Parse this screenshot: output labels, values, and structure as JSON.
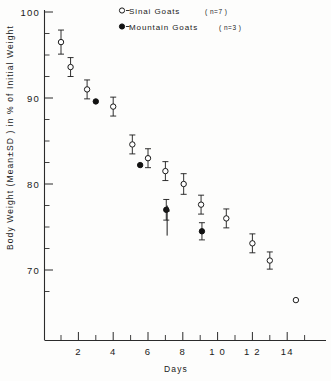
{
  "chart_data": {
    "type": "scatter",
    "title": "",
    "xlabel": "Days",
    "ylabel": "Body Weight (Mean±SD) in % of Initial Weight",
    "xlim": [
      0,
      15.5
    ],
    "ylim": [
      64.5,
      100
    ],
    "grid": false,
    "legend_position": "top-center",
    "x_ticks": [
      2,
      4,
      6,
      8,
      10,
      12,
      14
    ],
    "x_tick_labels": [
      "2",
      "4",
      "6",
      "8",
      "1 0",
      "1 2",
      "14"
    ],
    "x_minor_ticks": [
      1,
      3,
      5,
      7,
      9,
      11,
      13,
      15
    ],
    "y_ticks": [
      70,
      80,
      90,
      100
    ],
    "y_tick_labels": [
      "70",
      "80",
      "90",
      "100"
    ],
    "y_minor_ticks": [
      67.5,
      72.5,
      75,
      77.5,
      82.5,
      85,
      87.5,
      92.5,
      95,
      97.5
    ],
    "series": [
      {
        "name": "Sinai Goats",
        "sample_size": "n=7",
        "marker": "open-circle",
        "legend_label": "o - Sinai  Goats",
        "legend_n": "( n=7 )",
        "points": [
          {
            "x": 1.0,
            "y": 96.5,
            "sd": 1.4
          },
          {
            "x": 1.55,
            "y": 93.6,
            "sd": 1.1
          },
          {
            "x": 2.5,
            "y": 91.0,
            "sd": 1.1
          },
          {
            "x": 4.0,
            "y": 89.0,
            "sd": 1.1
          },
          {
            "x": 5.1,
            "y": 84.6,
            "sd": 1.1
          },
          {
            "x": 6.0,
            "y": 83.0,
            "sd": 1.1
          },
          {
            "x": 7.0,
            "y": 81.5,
            "sd": 1.1
          },
          {
            "x": 8.05,
            "y": 80.0,
            "sd": 1.2
          },
          {
            "x": 9.05,
            "y": 77.6,
            "sd": 1.1
          },
          {
            "x": 10.5,
            "y": 76.0,
            "sd": 1.1
          },
          {
            "x": 12.0,
            "y": 73.1,
            "sd": 1.1
          },
          {
            "x": 13.0,
            "y": 71.1,
            "sd": 1.0
          },
          {
            "x": 14.5,
            "y": 66.5,
            "sd": 0.0
          }
        ]
      },
      {
        "name": "Mountain Goats",
        "sample_size": "n=3",
        "marker": "filled-circle",
        "legend_label": "• - Mountain Goats",
        "legend_n": "( n=3 )",
        "points": [
          {
            "x": 3.0,
            "y": 89.6,
            "sd": 0.0
          },
          {
            "x": 5.55,
            "y": 82.2,
            "sd": 0.0
          },
          {
            "x": 7.05,
            "y": 77.0,
            "sd": 1.2
          },
          {
            "x": 9.1,
            "y": 74.5,
            "sd": 1.0
          }
        ]
      }
    ],
    "annotations": [
      {
        "type": "arrow",
        "x": 7.1,
        "y_from": 74.0,
        "y_to": 77.5,
        "direction": "up"
      }
    ]
  },
  "legend": {
    "entries": [
      {
        "marker": "open-circle",
        "dash": "-",
        "label": "Sinai  Goats",
        "n": "( n=7 )"
      },
      {
        "marker": "filled-circle",
        "dash": "-",
        "label": "Mountain Goats",
        "n": "( n=3 )"
      }
    ]
  },
  "axes": {
    "x_title": "Days",
    "y_title_parts": [
      "Body Weight (Mean",
      "±",
      "SD ) in % of Initial Weight"
    ],
    "y_title_full": "Body Weight (Mean±SD ) in % of Initial Weight"
  }
}
